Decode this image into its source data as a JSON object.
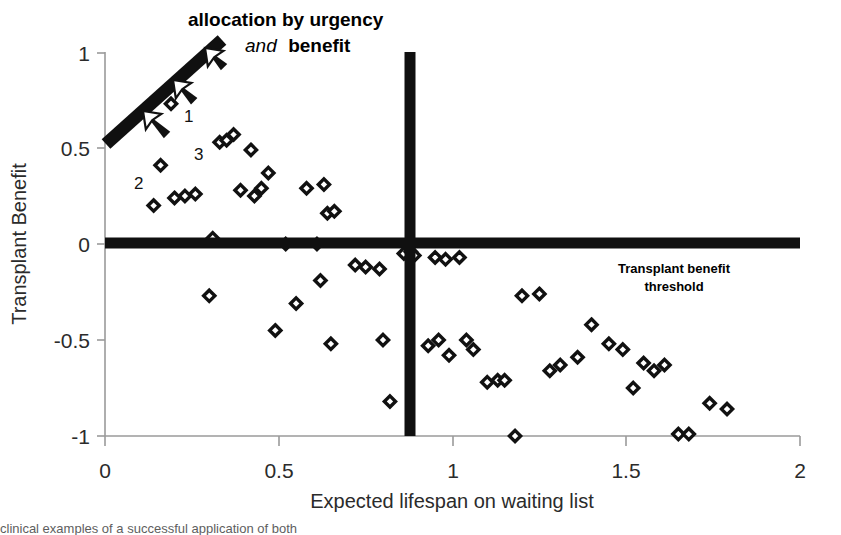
{
  "chart_data": {
    "type": "scatter",
    "title": "",
    "xlabel": "Expected lifespan on waiting list",
    "ylabel": "Transplant Benefit",
    "xlim": [
      0,
      2
    ],
    "ylim": [
      -1,
      1
    ],
    "xticks": [
      "0",
      "0.5",
      "1",
      "1.5",
      "2"
    ],
    "xtick_values": [
      0,
      0.5,
      1,
      1.5,
      2
    ],
    "yticks": [
      "1",
      "0.5",
      "0",
      "-0.5",
      "-1"
    ],
    "ytick_values": [
      1,
      0.5,
      0,
      -0.5,
      -1
    ],
    "grid": false,
    "legend": "none",
    "marker": "open-diamond",
    "marker_color": "#111111",
    "series": [
      {
        "name": "patients",
        "points": [
          [
            0.19,
            0.73
          ],
          [
            0.16,
            0.41
          ],
          [
            0.14,
            0.2
          ],
          [
            0.2,
            0.24
          ],
          [
            0.23,
            0.25
          ],
          [
            0.26,
            0.26
          ],
          [
            0.33,
            0.53
          ],
          [
            0.35,
            0.54
          ],
          [
            0.37,
            0.57
          ],
          [
            0.31,
            0.03
          ],
          [
            0.3,
            -0.27
          ],
          [
            0.42,
            0.49
          ],
          [
            0.39,
            0.28
          ],
          [
            0.47,
            0.37
          ],
          [
            0.45,
            0.29
          ],
          [
            0.43,
            0.25
          ],
          [
            0.49,
            -0.45
          ],
          [
            0.52,
            0.0
          ],
          [
            0.55,
            -0.31
          ],
          [
            0.58,
            0.29
          ],
          [
            0.61,
            0.0
          ],
          [
            0.63,
            0.31
          ],
          [
            0.64,
            0.16
          ],
          [
            0.66,
            0.17
          ],
          [
            0.62,
            -0.19
          ],
          [
            0.65,
            -0.52
          ],
          [
            0.72,
            -0.11
          ],
          [
            0.75,
            -0.12
          ],
          [
            0.79,
            -0.13
          ],
          [
            0.8,
            -0.5
          ],
          [
            0.82,
            -0.82
          ],
          [
            0.86,
            -0.05
          ],
          [
            0.88,
            -0.04
          ],
          [
            0.89,
            -0.06
          ],
          [
            0.95,
            -0.07
          ],
          [
            0.98,
            -0.08
          ],
          [
            0.93,
            -0.53
          ],
          [
            0.96,
            -0.5
          ],
          [
            0.99,
            -0.58
          ],
          [
            1.02,
            -0.07
          ],
          [
            1.04,
            -0.5
          ],
          [
            1.06,
            -0.55
          ],
          [
            1.1,
            -0.72
          ],
          [
            1.13,
            -0.71
          ],
          [
            1.15,
            -0.71
          ],
          [
            1.18,
            -1.0
          ],
          [
            1.2,
            -0.27
          ],
          [
            1.25,
            -0.26
          ],
          [
            1.28,
            -0.66
          ],
          [
            1.31,
            -0.63
          ],
          [
            1.36,
            -0.59
          ],
          [
            1.4,
            -0.42
          ],
          [
            1.45,
            -0.52
          ],
          [
            1.49,
            -0.55
          ],
          [
            1.52,
            -0.75
          ],
          [
            1.55,
            -0.62
          ],
          [
            1.58,
            -0.66
          ],
          [
            1.61,
            -0.63
          ],
          [
            1.65,
            -0.99
          ],
          [
            1.68,
            -0.99
          ],
          [
            1.74,
            -0.83
          ],
          [
            1.79,
            -0.86
          ]
        ]
      }
    ],
    "annotations": {
      "point_labels": [
        {
          "text": "1",
          "x": 0.23,
          "y": 0.71
        },
        {
          "text": "2",
          "x": 0.1,
          "y": 0.38
        },
        {
          "text": "3",
          "x": 0.285,
          "y": 0.5
        }
      ],
      "callout": {
        "line1": "allocation by urgency",
        "line2_italic": "and",
        "line2_bold": "benefit"
      },
      "threshold_label_line1": "Transplant benefit",
      "threshold_label_line2": "threshold",
      "arrows_count": 3,
      "benefit_threshold_y": 0,
      "urgency_threshold_x": 0.87,
      "allocation_line": {
        "x0": 0.0,
        "y0": 0.53,
        "x1": 0.33,
        "y1": 1.09
      }
    }
  },
  "caption": {
    "partial_text": "clinical examples of a successful application of both"
  },
  "colors": {
    "ink": "#111111",
    "axis": "#8c8c8c",
    "label": "#2b2b2b"
  }
}
